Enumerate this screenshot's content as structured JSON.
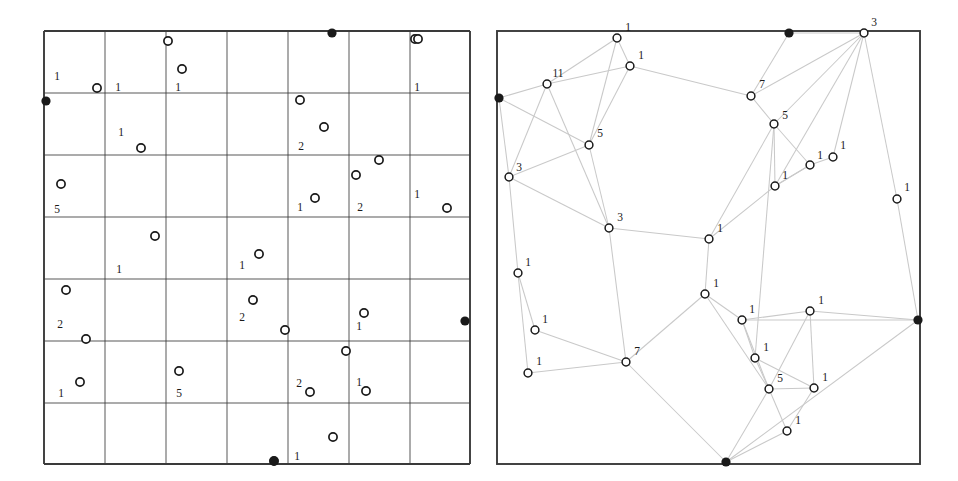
{
  "figure": {
    "type": "two-panel-diagram",
    "background": "#ffffff",
    "ink": "#1a1a1a",
    "edge_color": "#c9c9c9",
    "grid_color": "#3a3a3a",
    "width": 958,
    "height": 481
  },
  "left_panel": {
    "name": "grid-panel",
    "frame": {
      "x": 44,
      "y": 31,
      "width": 426,
      "height": 433
    },
    "grid": {
      "columns": 7,
      "rows": 7,
      "x_lines": [
        44,
        105,
        166,
        227,
        288,
        349,
        410,
        470
      ],
      "y_lines": [
        31,
        93,
        155,
        217,
        279,
        341,
        403,
        464
      ]
    },
    "boundary_nodes": [
      {
        "cx": 332,
        "cy": 33,
        "label": ""
      },
      {
        "cx": 46,
        "cy": 101,
        "label": ""
      },
      {
        "cx": 465,
        "cy": 321,
        "label": ""
      },
      {
        "cx": 274,
        "cy": 461,
        "label": ""
      }
    ],
    "points": [
      {
        "cx": 168,
        "cy": 41,
        "label": ""
      },
      {
        "cx": 415,
        "cy": 39,
        "label": ""
      },
      {
        "cx": 182,
        "cy": 69,
        "label": ""
      },
      {
        "cx": 97,
        "cy": 88,
        "label": "1",
        "lx": 57,
        "ly": 80
      },
      {
        "cx": 97,
        "cy": 88,
        "label": "1",
        "lx": 118,
        "ly": 91
      },
      {
        "cx": 182,
        "cy": 69,
        "label": "1",
        "lx": 178,
        "ly": 91
      },
      {
        "cx": 418,
        "cy": 39,
        "label": "1",
        "lx": 417,
        "ly": 91
      },
      {
        "cx": 300,
        "cy": 100,
        "label": ""
      },
      {
        "cx": 324,
        "cy": 127,
        "label": ""
      },
      {
        "cx": 141,
        "cy": 148,
        "label": ""
      },
      {
        "cx": 141,
        "cy": 148,
        "label": "1",
        "lx": 121,
        "ly": 136
      },
      {
        "cx": 324,
        "cy": 127,
        "label": "2",
        "lx": 301,
        "ly": 150
      },
      {
        "cx": 379,
        "cy": 160,
        "label": ""
      },
      {
        "cx": 356,
        "cy": 175,
        "label": ""
      },
      {
        "cx": 61,
        "cy": 184,
        "label": ""
      },
      {
        "cx": 315,
        "cy": 198,
        "label": ""
      },
      {
        "cx": 447,
        "cy": 208,
        "label": ""
      },
      {
        "cx": 61,
        "cy": 184,
        "label": "5",
        "lx": 57,
        "ly": 213
      },
      {
        "cx": 315,
        "cy": 198,
        "label": "1",
        "lx": 300,
        "ly": 211
      },
      {
        "cx": 356,
        "cy": 175,
        "label": "2",
        "lx": 360,
        "ly": 211
      },
      {
        "cx": 447,
        "cy": 208,
        "label": "1",
        "lx": 417,
        "ly": 198
      },
      {
        "cx": 155,
        "cy": 236,
        "label": ""
      },
      {
        "cx": 259,
        "cy": 254,
        "label": ""
      },
      {
        "cx": 259,
        "cy": 254,
        "label": "1",
        "lx": 242,
        "ly": 269
      },
      {
        "cx": 155,
        "cy": 236,
        "label": "1",
        "lx": 119,
        "ly": 273
      },
      {
        "cx": 66,
        "cy": 290,
        "label": ""
      },
      {
        "cx": 253,
        "cy": 300,
        "label": ""
      },
      {
        "cx": 364,
        "cy": 313,
        "label": ""
      },
      {
        "cx": 285,
        "cy": 330,
        "label": ""
      },
      {
        "cx": 66,
        "cy": 290,
        "label": "2",
        "lx": 60,
        "ly": 328
      },
      {
        "cx": 253,
        "cy": 300,
        "label": "2",
        "lx": 242,
        "ly": 321
      },
      {
        "cx": 364,
        "cy": 313,
        "label": "1",
        "lx": 359,
        "ly": 330
      },
      {
        "cx": 86,
        "cy": 339,
        "label": ""
      },
      {
        "cx": 346,
        "cy": 351,
        "label": ""
      },
      {
        "cx": 179,
        "cy": 371,
        "label": ""
      },
      {
        "cx": 80,
        "cy": 382,
        "label": ""
      },
      {
        "cx": 310,
        "cy": 392,
        "label": ""
      },
      {
        "cx": 366,
        "cy": 391,
        "label": ""
      },
      {
        "cx": 80,
        "cy": 382,
        "label": "1",
        "lx": 61,
        "ly": 397
      },
      {
        "cx": 179,
        "cy": 371,
        "label": "5",
        "lx": 179,
        "ly": 397
      },
      {
        "cx": 310,
        "cy": 392,
        "label": "2",
        "lx": 299,
        "ly": 387
      },
      {
        "cx": 366,
        "cy": 391,
        "label": "1",
        "lx": 359,
        "ly": 386
      },
      {
        "cx": 333,
        "cy": 437,
        "label": ""
      },
      {
        "cx": 274,
        "cy": 461,
        "label": "1",
        "lx": 297,
        "ly": 460
      }
    ]
  },
  "right_panel": {
    "name": "graph-panel",
    "frame": {
      "x": 497,
      "y": 31,
      "width": 423,
      "height": 433
    },
    "boundary_nodes": [
      {
        "id": "b0",
        "cx": 499,
        "cy": 98
      },
      {
        "id": "b1",
        "cx": 789,
        "cy": 33
      },
      {
        "id": "b2",
        "cx": 918,
        "cy": 320
      },
      {
        "id": "b3",
        "cx": 726,
        "cy": 462
      }
    ],
    "nodes": [
      {
        "id": "n1",
        "cx": 617,
        "cy": 38,
        "label": "1",
        "lx": 628,
        "ly": 31
      },
      {
        "id": "n2",
        "cx": 630,
        "cy": 66,
        "label": "1",
        "lx": 641,
        "ly": 59
      },
      {
        "id": "n3",
        "cx": 547,
        "cy": 84,
        "label": "11",
        "lx": 558,
        "ly": 77
      },
      {
        "id": "n4",
        "cx": 864,
        "cy": 33,
        "label": "3",
        "lx": 874,
        "ly": 26
      },
      {
        "id": "n5",
        "cx": 751,
        "cy": 96,
        "label": "7",
        "lx": 762,
        "ly": 88
      },
      {
        "id": "n6",
        "cx": 774,
        "cy": 124,
        "label": "5",
        "lx": 785,
        "ly": 119
      },
      {
        "id": "n7",
        "cx": 589,
        "cy": 145,
        "label": "5",
        "lx": 600,
        "ly": 137
      },
      {
        "id": "n8",
        "cx": 509,
        "cy": 177,
        "label": "3",
        "lx": 519,
        "ly": 171
      },
      {
        "id": "n9",
        "cx": 810,
        "cy": 165,
        "label": "1",
        "lx": 820,
        "ly": 159
      },
      {
        "id": "n10",
        "cx": 833,
        "cy": 157,
        "label": "1",
        "lx": 843,
        "ly": 149
      },
      {
        "id": "n11",
        "cx": 775,
        "cy": 186,
        "label": "1",
        "lx": 785,
        "ly": 179
      },
      {
        "id": "n12",
        "cx": 897,
        "cy": 199,
        "label": "1",
        "lx": 907,
        "ly": 191
      },
      {
        "id": "n13",
        "cx": 609,
        "cy": 228,
        "label": "3",
        "lx": 620,
        "ly": 221
      },
      {
        "id": "n14",
        "cx": 709,
        "cy": 239,
        "label": "1",
        "lx": 720,
        "ly": 232
      },
      {
        "id": "n15",
        "cx": 518,
        "cy": 273,
        "label": "1",
        "lx": 528,
        "ly": 266
      },
      {
        "id": "n16",
        "cx": 705,
        "cy": 294,
        "label": "1",
        "lx": 716,
        "ly": 287
      },
      {
        "id": "n17",
        "cx": 535,
        "cy": 330,
        "label": "1",
        "lx": 545,
        "ly": 323
      },
      {
        "id": "n18",
        "cx": 742,
        "cy": 320,
        "label": "1",
        "lx": 752,
        "ly": 313
      },
      {
        "id": "n19",
        "cx": 810,
        "cy": 311,
        "label": "1",
        "lx": 821,
        "ly": 304
      },
      {
        "id": "n20",
        "cx": 528,
        "cy": 373,
        "label": "1",
        "lx": 539,
        "ly": 365
      },
      {
        "id": "n21",
        "cx": 626,
        "cy": 362,
        "label": "7",
        "lx": 637,
        "ly": 355
      },
      {
        "id": "n22",
        "cx": 755,
        "cy": 358,
        "label": "1",
        "lx": 766,
        "ly": 351
      },
      {
        "id": "n23",
        "cx": 769,
        "cy": 389,
        "label": "5",
        "lx": 780,
        "ly": 382
      },
      {
        "id": "n24",
        "cx": 814,
        "cy": 388,
        "label": "1",
        "lx": 825,
        "ly": 381
      },
      {
        "id": "n25",
        "cx": 787,
        "cy": 431,
        "label": "1",
        "lx": 798,
        "ly": 424
      }
    ],
    "edges": [
      [
        "b0",
        "n3"
      ],
      [
        "b0",
        "n8"
      ],
      [
        "b0",
        "n7"
      ],
      [
        "n3",
        "n1"
      ],
      [
        "n3",
        "n2"
      ],
      [
        "n3",
        "n13"
      ],
      [
        "n3",
        "n8"
      ],
      [
        "n1",
        "n2"
      ],
      [
        "n1",
        "n7"
      ],
      [
        "n2",
        "n5"
      ],
      [
        "n2",
        "n7"
      ],
      [
        "b1",
        "n5"
      ],
      [
        "b1",
        "n4"
      ],
      [
        "n4",
        "n5"
      ],
      [
        "n4",
        "n6"
      ],
      [
        "n4",
        "n11"
      ],
      [
        "n4",
        "n10"
      ],
      [
        "n4",
        "n12"
      ],
      [
        "n5",
        "n6"
      ],
      [
        "n6",
        "n9"
      ],
      [
        "n6",
        "n11"
      ],
      [
        "n6",
        "n14"
      ],
      [
        "n6",
        "n22"
      ],
      [
        "n9",
        "n10"
      ],
      [
        "n9",
        "n11"
      ],
      [
        "n11",
        "n14"
      ],
      [
        "n11",
        "n9"
      ],
      [
        "n12",
        "b2"
      ],
      [
        "n7",
        "n8"
      ],
      [
        "n7",
        "n13"
      ],
      [
        "n8",
        "n13"
      ],
      [
        "n8",
        "n15"
      ],
      [
        "n13",
        "n14"
      ],
      [
        "n13",
        "n21"
      ],
      [
        "n14",
        "n16"
      ],
      [
        "n16",
        "n18"
      ],
      [
        "n16",
        "n21"
      ],
      [
        "n16",
        "n23"
      ],
      [
        "n15",
        "n17"
      ],
      [
        "n15",
        "n20"
      ],
      [
        "n17",
        "n21"
      ],
      [
        "n20",
        "n21"
      ],
      [
        "n21",
        "b3"
      ],
      [
        "n18",
        "b2"
      ],
      [
        "n18",
        "n23"
      ],
      [
        "n18",
        "n19"
      ],
      [
        "n18",
        "n22"
      ],
      [
        "n19",
        "b2"
      ],
      [
        "n19",
        "n24"
      ],
      [
        "n19",
        "n23"
      ],
      [
        "n22",
        "n23"
      ],
      [
        "n22",
        "n24"
      ],
      [
        "n23",
        "n24"
      ],
      [
        "n23",
        "n25"
      ],
      [
        "n23",
        "b3"
      ],
      [
        "n24",
        "n25"
      ],
      [
        "n25",
        "b3"
      ],
      [
        "b2",
        "b3"
      ]
    ]
  }
}
